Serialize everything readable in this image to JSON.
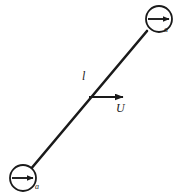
{
  "figure": {
    "type": "physics-diagram",
    "background_color": "#ffffff",
    "stroke_color": "#1a1a1a",
    "labels": {
      "length": "l",
      "velocity": "U",
      "charge_top": "a",
      "charge_bottom": "a"
    },
    "elements": {
      "rod": {
        "name": "connecting-rod",
        "x1": 30,
        "y1": 170,
        "x2": 147,
        "y2": 31,
        "stroke_width": 2.6
      },
      "circle_top": {
        "name": "top-right-charge",
        "cx": 159,
        "cy": 19,
        "r": 13,
        "stroke_width": 1.8,
        "arrow": {
          "x1": 148,
          "y1": 19,
          "x2": 171,
          "y2": 19
        }
      },
      "circle_bottom": {
        "name": "bottom-left-charge",
        "cx": 23,
        "cy": 178,
        "r": 13,
        "stroke_width": 1.8,
        "arrow": {
          "x1": 12,
          "y1": 178,
          "x2": 35,
          "y2": 178
        }
      },
      "velocity_arrow": {
        "name": "velocity-vector",
        "x1": 89,
        "y1": 97,
        "x2": 126,
        "y2": 97,
        "stroke_width": 2.0
      }
    }
  }
}
